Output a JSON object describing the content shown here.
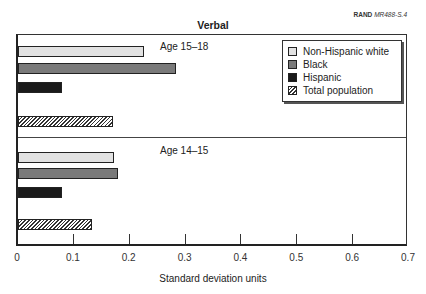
{
  "header": {
    "source_prefix": "RAND",
    "source_id": "MR488-S.4"
  },
  "chart_data": {
    "type": "bar",
    "orientation": "horizontal",
    "title": "Verbal",
    "xlabel": "Standard deviation units",
    "ylabel": "",
    "xlim": [
      0,
      0.7
    ],
    "xticks": [
      "0",
      "0.1",
      "0.2",
      "0.3",
      "0.4",
      "0.5",
      "0.6",
      "0.7"
    ],
    "grid": false,
    "legend_position": "upper right",
    "categories": [
      "Age 15–18",
      "Age 14–15"
    ],
    "series": [
      {
        "name": "Non-Hispanic white",
        "color": "#e2e2e2",
        "values": [
          0.226,
          0.172
        ]
      },
      {
        "name": "Black",
        "color": "#7a7a7a",
        "values": [
          0.283,
          0.179
        ]
      },
      {
        "name": "Hispanic",
        "color": "#1a1a1a",
        "values": [
          0.079,
          0.079
        ]
      },
      {
        "name": "Total population",
        "color": "hatched",
        "values": [
          0.17,
          0.132
        ]
      }
    ]
  },
  "legend": [
    {
      "label": "Non-Hispanic white"
    },
    {
      "label": "Black"
    },
    {
      "label": "Hispanic"
    },
    {
      "label": "Total population"
    }
  ],
  "panels": [
    {
      "label": "Age 15–18"
    },
    {
      "label": "Age 14–15"
    }
  ]
}
